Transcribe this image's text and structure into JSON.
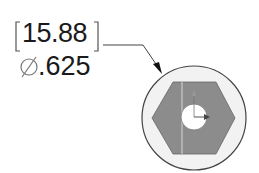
{
  "dimension": {
    "primary_value": "15.88",
    "secondary_value": ".625",
    "diameter_symbol": "diameter-icon"
  },
  "colors": {
    "line": "#333333",
    "hex_fill": "#8c8c8c",
    "circle_fill": "#f2f2f2"
  }
}
